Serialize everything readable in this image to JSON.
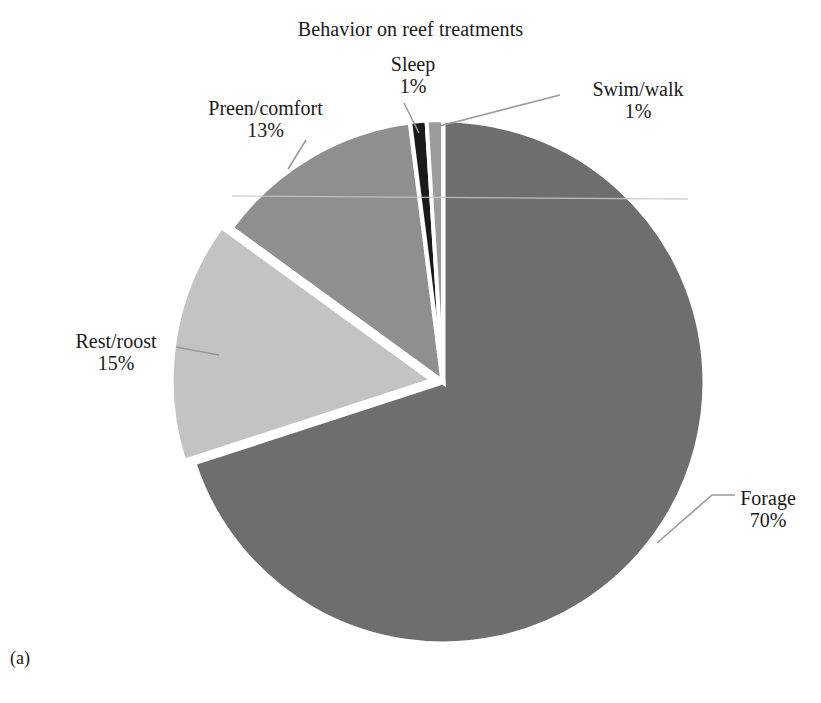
{
  "figure": {
    "panel_label": "(a)",
    "background_color": "#ffffff",
    "text_color": "#1a1a1a",
    "separator_color": "#ffffff",
    "leader_line_color": "#9a9a9a"
  },
  "chart_data": {
    "type": "pie",
    "title": "Behavior on reef treatments",
    "xlabel": "",
    "ylabel": "",
    "legend_position": "none",
    "grid": false,
    "labels_outside": true,
    "value_suffix": "%",
    "start_angle_deg": 0,
    "direction": "clockwise",
    "categories": [
      "Forage",
      "Rest/roost",
      "Preen/comfort",
      "Sleep",
      "Swim/walk"
    ],
    "values": [
      70,
      15,
      13,
      1,
      1
    ],
    "colors": [
      "#6e6e6e",
      "#c3c3c3",
      "#8f8f8f",
      "#1a1a1a",
      "#9c9c9c"
    ],
    "exploded": [
      false,
      true,
      false,
      false,
      false
    ],
    "slices": [
      {
        "name": "Forage",
        "value": 70,
        "value_label": "70%",
        "color": "#6e6e6e",
        "exploded": false,
        "start_angle_deg": 0,
        "end_angle_deg": 252
      },
      {
        "name": "Rest/roost",
        "value": 15,
        "value_label": "15%",
        "color": "#c3c3c3",
        "exploded": true,
        "start_angle_deg": 252,
        "end_angle_deg": 306
      },
      {
        "name": "Preen/comfort",
        "value": 13,
        "value_label": "13%",
        "color": "#8f8f8f",
        "exploded": false,
        "start_angle_deg": 306,
        "end_angle_deg": 352.8
      },
      {
        "name": "Sleep",
        "value": 1,
        "value_label": "1%",
        "color": "#1a1a1a",
        "exploded": false,
        "start_angle_deg": 352.8,
        "end_angle_deg": 356.4
      },
      {
        "name": "Swim/walk",
        "value": 1,
        "value_label": "1%",
        "color": "#9c9c9c",
        "exploded": false,
        "start_angle_deg": 356.4,
        "end_angle_deg": 360
      }
    ]
  }
}
